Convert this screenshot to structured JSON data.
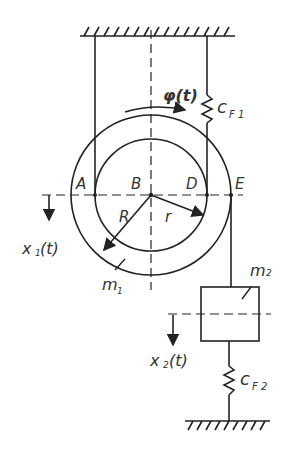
{
  "diagram": {
    "labels": {
      "phi": "φ(t)",
      "cF1": "c",
      "cF1_sub": "F 1",
      "A": "A",
      "B": "B",
      "D": "D",
      "E": "E",
      "R": "R",
      "r": "r",
      "x1": "x",
      "x1_sub": "1",
      "x1_arg": "(t)",
      "m1": "m",
      "m1_sub": "1",
      "m2": "m",
      "m2_sub": "2",
      "x2": "x",
      "x2_sub": "2",
      "x2_arg": "(t)",
      "cF2": "c",
      "cF2_sub": "F 2"
    },
    "line_color": "#222222",
    "text_color": "#333333"
  }
}
